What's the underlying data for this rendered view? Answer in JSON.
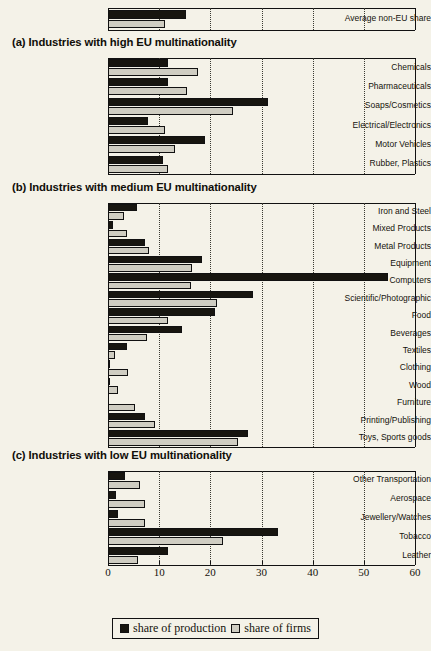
{
  "figure": {
    "background_color": "#f4f2e8",
    "bar_color_production": "#17150f",
    "bar_color_firms": "#cfcdc2"
  },
  "legend": {
    "items": [
      {
        "label": "share of production",
        "swatch": "black"
      },
      {
        "label": "share of firms",
        "swatch": "gray"
      }
    ]
  },
  "sections": [
    {
      "id": "top",
      "title": ""
    },
    {
      "id": "a",
      "title": "(a) Industries with high EU multinationality"
    },
    {
      "id": "b",
      "title": "(b) Industries with medium EU multinationality"
    },
    {
      "id": "c",
      "title": "(c) Industries with low EU multinationality"
    }
  ],
  "axis": {
    "ticks": [
      "0",
      "10",
      "20",
      "30",
      "40",
      "50",
      "60"
    ],
    "min": 0,
    "max": 60
  },
  "chart_data": {
    "type": "bar",
    "orientation": "horizontal",
    "title": "",
    "xlabel": "",
    "ylabel": "",
    "xlim": [
      0,
      60
    ],
    "xticks": [
      0,
      10,
      20,
      30,
      40,
      50,
      60
    ],
    "grid": "vertical dotted gridlines at 10,20,30,40,50",
    "legend": [
      "share of production",
      "share of firms"
    ],
    "legend_position": "bottom-center",
    "panels": [
      {
        "name": "summary",
        "title": "",
        "categories": [
          "Average non-EU share"
        ],
        "series": [
          {
            "name": "share of production",
            "values": [
              15.2
            ]
          },
          {
            "name": "share of firms",
            "values": [
              11.1
            ]
          }
        ]
      },
      {
        "name": "a",
        "title": "(a) Industries with high EU multinationality",
        "categories": [
          "Chemicals",
          "Pharmaceuticals",
          "Soaps/Cosmetics",
          "Electrical/Electronics",
          "Motor Vehicles",
          "Rubber, Plastics"
        ],
        "series": [
          {
            "name": "share of production",
            "values": [
              11.7,
              11.7,
              31.3,
              7.8,
              19.0,
              10.8
            ]
          },
          {
            "name": "share of firms",
            "values": [
              17.6,
              15.4,
              24.4,
              11.2,
              13.0,
              11.7
            ]
          }
        ]
      },
      {
        "name": "b",
        "title": "(b) Industries with medium EU multinationality",
        "categories": [
          "Iron and Steel",
          "Mixed Products",
          "Metal Products",
          "Equipment",
          "Computers",
          "Scientific/Photographic",
          "Food",
          "Beverages",
          "Textiles",
          "Clothing",
          "Wood",
          "Furniture",
          "Printing/Publishing",
          "Toys, Sports goods"
        ],
        "series": [
          {
            "name": "share of production",
            "values": [
              5.6,
              1.0,
              7.2,
              18.3,
              54.7,
              28.3,
              20.9,
              14.4,
              3.7,
              0.3,
              0.2,
              0.0,
              7.2,
              27.3
            ]
          },
          {
            "name": "share of firms",
            "values": [
              3.1,
              3.7,
              8.0,
              16.4,
              16.2,
              21.3,
              11.7,
              7.6,
              1.4,
              4.0,
              2.0,
              5.3,
              9.2,
              25.4
            ]
          }
        ]
      },
      {
        "name": "c",
        "title": "(c) Industries with low EU multinationality",
        "categories": [
          "Other Transportation",
          "Aerospace",
          "Jewellery/Watches",
          "Tobacco",
          "Leather"
        ],
        "series": [
          {
            "name": "share of production",
            "values": [
              3.3,
              1.6,
              2.0,
              33.2,
              11.7
            ]
          },
          {
            "name": "share of firms",
            "values": [
              6.2,
              7.2,
              7.2,
              22.5,
              5.9
            ]
          }
        ]
      }
    ]
  }
}
